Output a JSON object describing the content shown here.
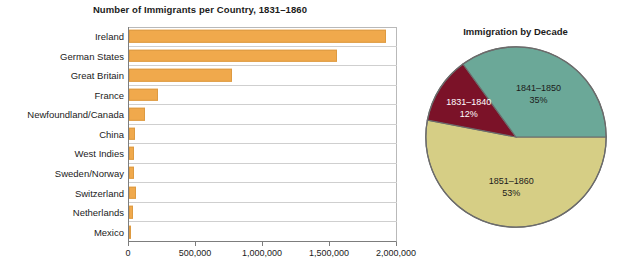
{
  "chart_data": [
    {
      "type": "bar",
      "title": "Number of Immigrants per Country, 1831–1860",
      "orientation": "horizontal",
      "xlabel": "",
      "ylabel": "",
      "xlim": [
        0,
        2000000
      ],
      "grid": true,
      "tick_labels": [
        "0",
        "500,000",
        "1,000,000",
        "1,500,000",
        "2,000,000"
      ],
      "ticks": [
        0,
        500000,
        1000000,
        1500000,
        2000000
      ],
      "bar_color": "#f0a94c",
      "categories": [
        "Ireland",
        "German States",
        "Great Britain",
        "France",
        "Newfoundland/Canada",
        "China",
        "West Indies",
        "Sweden/Norway",
        "Switzerland",
        "Netherlands",
        "Mexico"
      ],
      "values": [
        1920000,
        1550000,
        770000,
        215000,
        120000,
        45000,
        40000,
        40000,
        50000,
        30000,
        5000
      ]
    },
    {
      "type": "pie",
      "title": "Immigration by Decade",
      "labels": [
        "1851–1860",
        "1831–1840",
        "1841–1850"
      ],
      "values": [
        53,
        35,
        12
      ],
      "slices": [
        {
          "label": "1851–1860",
          "percent_text": "53%",
          "value": 53,
          "color": "#d6ce85",
          "label_color": "dark"
        },
        {
          "label": "1831–1840",
          "percent_text": "12%",
          "value": 12,
          "color": "#7b1228",
          "label_color": "light"
        },
        {
          "label": "1841–1850",
          "percent_text": "35%",
          "value": 35,
          "color": "#6ba898",
          "label_color": "dark"
        }
      ],
      "legend": "none"
    }
  ]
}
